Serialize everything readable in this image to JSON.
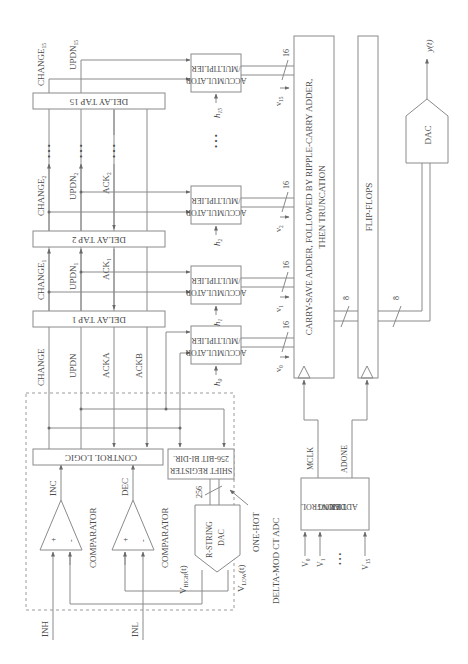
{
  "diagram": {
    "orientation": "rotated 90 degrees counter-clockwise",
    "inputs": {
      "inh": "INH",
      "inl": "INL"
    },
    "adc": {
      "title": "DELTA-MOD CT ADC",
      "comparator_top": "COMPARATOR",
      "comparator_bottom": "COMPARATOR",
      "inc": "INC",
      "dec": "DEC",
      "control_logic": "CONTROL LOGIC",
      "shift_register_line1": "256-BIT BI-DIR.",
      "shift_register_line2": "SHIFT REGISTER",
      "bus_256": "256",
      "one_hot": "ONE-HOT",
      "dac_line1": "R-STRING",
      "dac_line2": "DAC",
      "vhigh": "V",
      "vhigh_sub": "HIGH",
      "vhigh_suffix": "(t)",
      "vlow": "V",
      "vlow_sub": "LOW",
      "vlow_suffix": "(t)",
      "plus": "+",
      "minus": "-"
    },
    "signals": {
      "change": "CHANGE",
      "updn": "UPDN",
      "acka": "ACKA",
      "ackb": "ACKB",
      "change1": "CHANGE",
      "change1_sub": "1",
      "updn1": "UPDN",
      "updn1_sub": "1",
      "ack1": "ACK",
      "ack1_sub": "1",
      "change2": "CHANGE",
      "change2_sub": "2",
      "updn2": "UPDN",
      "updn2_sub": "2",
      "ack2": "ACK",
      "ack2_sub": "2",
      "change15": "CHANGE",
      "change15_sub": "15",
      "updn15": "UPDN",
      "updn15_sub": "15",
      "ellipsis": "• • •"
    },
    "delay_taps": [
      {
        "label": "DELAY TAP 1"
      },
      {
        "label": "DELAY TAP 2"
      },
      {
        "label": "DELAY TAP 15"
      }
    ],
    "accumulators": [
      {
        "line1": "ACCUMULATOR",
        "line2": "/MULTIPLIER",
        "h": "h",
        "h_sub": "0",
        "v": "v",
        "v_sub": "0",
        "bus": "16"
      },
      {
        "line1": "ACCUMULATOR",
        "line2": "/MULTIPLIER",
        "h": "h",
        "h_sub": "1",
        "v": "v",
        "v_sub": "1",
        "bus": "16"
      },
      {
        "line1": "ACCUMULATOR",
        "line2": "/MULTIPLIER",
        "h": "h",
        "h_sub": "2",
        "v": "v",
        "v_sub": "2",
        "bus": "16"
      },
      {
        "line1": "ACCUMULATOR",
        "line2": "/MULTIPLIER",
        "h": "h",
        "h_sub": "15",
        "v": "v",
        "v_sub": "15",
        "bus": "16"
      }
    ],
    "adder": {
      "line1": "CARRY-SAVE ADDER, FOLLOWED BY RIPPLE-CARRY ADDER,",
      "line2": "THEN TRUNCATION",
      "bus_out": "8"
    },
    "flipflops": {
      "label": "FLIP-FLOPS",
      "bus_out": "8"
    },
    "timing": {
      "line1": "ADDER",
      "line2": "TIMING",
      "line3": "CONTROL",
      "mclk": "MCLK",
      "adone": "ADONE",
      "v0": "V",
      "v0_sub": "0",
      "v1": "V",
      "v1_sub": "1",
      "v15": "V",
      "v15_sub": "15",
      "ellipsis": "• • •"
    },
    "output_dac": {
      "label": "DAC",
      "output": "y(t)"
    }
  }
}
